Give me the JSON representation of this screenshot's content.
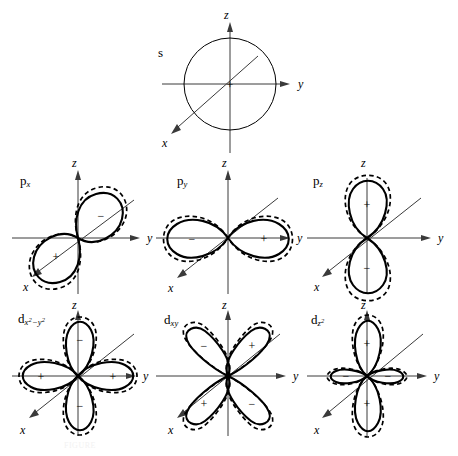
{
  "figure": {
    "caption": "FIGURE",
    "axes": {
      "z": "z",
      "y": "y",
      "x": "x"
    },
    "signs": {
      "positive": "+",
      "negative": "−"
    }
  },
  "panels": [
    {
      "id": "s",
      "label_main": "s",
      "label_sub": "",
      "label_sup": "",
      "type": "sphere",
      "lobes": [
        {
          "sign": "+",
          "direction": "center"
        }
      ]
    },
    {
      "id": "px",
      "label_main": "p",
      "label_sub": "x",
      "label_sup": "",
      "type": "dumbbell-diagonal",
      "lobes": [
        {
          "sign": "+",
          "direction": "lower-left"
        },
        {
          "sign": "−",
          "direction": "upper-right"
        }
      ]
    },
    {
      "id": "py",
      "label_main": "p",
      "label_sub": "y",
      "label_sup": "",
      "type": "dumbbell-horizontal",
      "lobes": [
        {
          "sign": "−",
          "direction": "left"
        },
        {
          "sign": "+",
          "direction": "right"
        }
      ]
    },
    {
      "id": "pz",
      "label_main": "p",
      "label_sub": "z",
      "label_sup": "",
      "type": "dumbbell-vertical",
      "lobes": [
        {
          "sign": "+",
          "direction": "up"
        },
        {
          "sign": "−",
          "direction": "down"
        }
      ]
    },
    {
      "id": "dx2y2",
      "label_main": "d",
      "label_sub": "x",
      "label_sup": "2−y2",
      "type": "cloverleaf-axial",
      "lobes": [
        {
          "sign": "+",
          "direction": "left"
        },
        {
          "sign": "+",
          "direction": "right"
        },
        {
          "sign": "−",
          "direction": "up"
        },
        {
          "sign": "−",
          "direction": "down"
        }
      ]
    },
    {
      "id": "dxy",
      "label_main": "d",
      "label_sub": "xy",
      "label_sup": "",
      "type": "cloverleaf-diagonal",
      "lobes": [
        {
          "sign": "−",
          "direction": "upper-left"
        },
        {
          "sign": "+",
          "direction": "upper-right"
        },
        {
          "sign": "+",
          "direction": "lower-left"
        },
        {
          "sign": "−",
          "direction": "lower-right"
        }
      ]
    },
    {
      "id": "dz2",
      "label_main": "d",
      "label_sub": "z",
      "label_sup": "2",
      "type": "dumbbell-with-collar",
      "lobes": [
        {
          "sign": "+",
          "direction": "up"
        },
        {
          "sign": "+",
          "direction": "down"
        },
        {
          "sign": "−",
          "direction": "left"
        },
        {
          "sign": "−",
          "direction": "right"
        }
      ]
    }
  ]
}
